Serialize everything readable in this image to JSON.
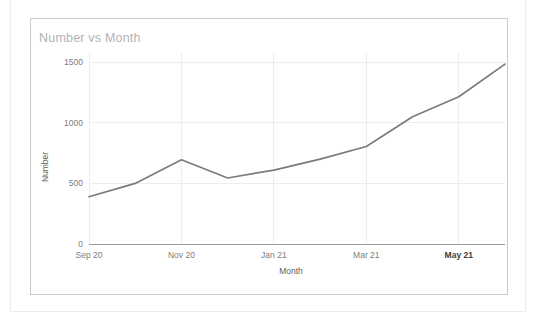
{
  "card": {
    "title": "Number vs Month"
  },
  "chart_data": {
    "type": "line",
    "title": "Number vs Month",
    "xlabel": "Month",
    "ylabel": "Number",
    "grid": true,
    "legend": "none",
    "xlim": [
      "Sep 20",
      "Jun 21"
    ],
    "ylim": [
      0,
      1560
    ],
    "yticks": [
      0,
      500,
      1000,
      1500
    ],
    "ytick_labels": [
      "0",
      "500",
      "1000",
      "1500"
    ],
    "xticks": [
      "Sep 20",
      "Nov 20",
      "Jan 21",
      "Mar 21",
      "May 21"
    ],
    "xtick_emphasis": "May 21",
    "series": [
      {
        "name": "Number",
        "color": "#7b7b7b",
        "x": [
          "Sep 20",
          "Oct 20",
          "Nov 20",
          "Dec 20",
          "Jan 21",
          "Feb 21",
          "Mar 21",
          "Apr 21",
          "May 21",
          "Jun 21"
        ],
        "values": [
          390,
          500,
          695,
          545,
          610,
          700,
          805,
          1050,
          1215,
          1485
        ]
      }
    ]
  }
}
